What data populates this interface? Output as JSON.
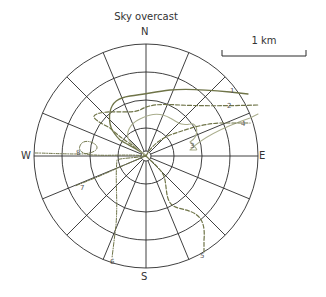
{
  "title": "Sky overcast",
  "compass": {
    "north": "N",
    "south": "S",
    "east": "E",
    "west": "W"
  },
  "scale_bar": {
    "label": "1 km"
  },
  "grid": {
    "rings": 4,
    "spokes": 16
  },
  "colors": {
    "grid": "#2a2a2a",
    "path_dark": "#6f7448",
    "path_light": "#a9ad8c",
    "text": "#333333"
  },
  "paths": [
    {
      "id": "1",
      "label": "1",
      "style": "solid"
    },
    {
      "id": "2",
      "label": "2",
      "style": "dashed"
    },
    {
      "id": "3",
      "label": "3",
      "style": "solid-light"
    },
    {
      "id": "4",
      "label": "4",
      "style": "dashed"
    },
    {
      "id": "5",
      "label": "5",
      "style": "dashed"
    },
    {
      "id": "6",
      "label": "6",
      "style": "dash-dot"
    },
    {
      "id": "7",
      "label": "7",
      "style": "dash-dot"
    },
    {
      "id": "8",
      "label": "8",
      "style": "dashed"
    }
  ]
}
